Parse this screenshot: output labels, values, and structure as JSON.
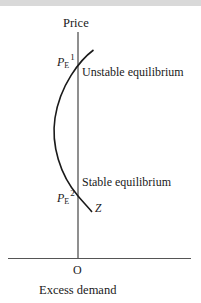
{
  "diagram": {
    "type": "excess-demand-curve",
    "y_axis_label": "Price",
    "x_axis_label": "Excess demand",
    "origin_label": "O",
    "curve_label": "Z",
    "equilibria": [
      {
        "price_symbol": "P",
        "price_subscript": "E",
        "price_superscript": "1",
        "annotation": "Unstable equilibrium"
      },
      {
        "price_symbol": "P",
        "price_subscript": "E",
        "price_superscript": "2",
        "annotation": "Stable equilibrium"
      }
    ],
    "colors": {
      "line": "#1a1a1a",
      "axis": "#333333",
      "background": "#ffffff",
      "top_strip": "#d9d9d9"
    }
  }
}
